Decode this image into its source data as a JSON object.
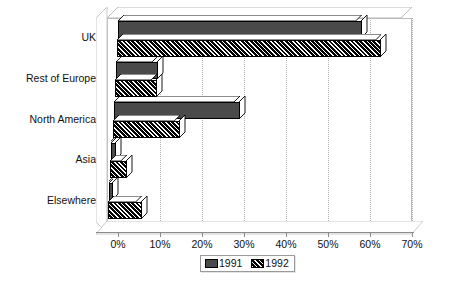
{
  "chart_data": {
    "type": "bar",
    "orientation": "horizontal",
    "title": "",
    "subtitle": "",
    "xlabel": "",
    "ylabel": "",
    "xlim": [
      0,
      70
    ],
    "xtick_labels": [
      "0%",
      "10%",
      "20%",
      "30%",
      "40%",
      "50%",
      "60%",
      "70%"
    ],
    "xtick_values": [
      0,
      10,
      20,
      30,
      40,
      50,
      60,
      70
    ],
    "xtick_suffix": "%",
    "grid": true,
    "grid_axis": "x",
    "grid_style": "dotted",
    "three_d": true,
    "legend_position": "bottom-center",
    "categories": [
      "UK",
      "Rest of Europe",
      "North America",
      "Asia",
      "Elsewhere"
    ],
    "series": [
      {
        "name": "1991",
        "color": "#4a4a4a",
        "pattern": "solid",
        "values": [
          58,
          10,
          30,
          1,
          1
        ]
      },
      {
        "name": "1992",
        "color": "#000000",
        "pattern": "diagonal-hatch",
        "values": [
          63,
          10,
          16,
          4,
          8
        ]
      }
    ],
    "legend": [
      {
        "label": "1991",
        "swatch": "solid-dark-gray"
      },
      {
        "label": "1992",
        "swatch": "diagonal-hatch-black"
      }
    ]
  }
}
